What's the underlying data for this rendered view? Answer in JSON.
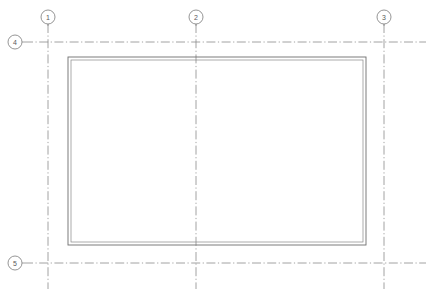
{
  "drawing": {
    "title": "Floor Plan",
    "background_color": "#ffffff",
    "line_color": "#8c8c8c",
    "wall_color": "#6e6e6e",
    "bubble_text_color": "#5a5a5a",
    "canvas": {
      "width": 430,
      "height": 293
    }
  },
  "grid_bubbles": [
    {
      "label": "1",
      "cx": 48,
      "cy": 17,
      "r": 7,
      "axis": "vertical",
      "leader_to": 26
    },
    {
      "label": "2",
      "cx": 196,
      "cy": 17,
      "r": 7,
      "axis": "vertical",
      "leader_to": 26
    },
    {
      "label": "3",
      "cx": 384,
      "cy": 17,
      "r": 7,
      "axis": "vertical",
      "leader_to": 26
    },
    {
      "label": "4",
      "cx": 15,
      "cy": 42,
      "r": 7,
      "axis": "horizontal",
      "leader_to": 24
    },
    {
      "label": "5",
      "cx": 15,
      "cy": 263,
      "r": 7,
      "axis": "horizontal",
      "leader_to": 24
    }
  ],
  "grid_lines": {
    "vertical": [
      {
        "label": "1",
        "x": 48,
        "y1": 24,
        "y2": 289
      },
      {
        "label": "2",
        "x": 196,
        "y1": 24,
        "y2": 289
      },
      {
        "label": "3",
        "x": 384,
        "y1": 24,
        "y2": 289
      }
    ],
    "horizontal": [
      {
        "label": "4",
        "y": 42,
        "x1": 24,
        "x2": 426
      },
      {
        "label": "5",
        "y": 263,
        "x1": 24,
        "x2": 426
      }
    ]
  },
  "building": {
    "name": "building-outline",
    "wall_style": "double-line",
    "outer": {
      "x": 68,
      "y": 57,
      "width": 298,
      "height": 188
    },
    "inner": {
      "x": 71,
      "y": 60,
      "width": 292,
      "height": 182
    }
  }
}
